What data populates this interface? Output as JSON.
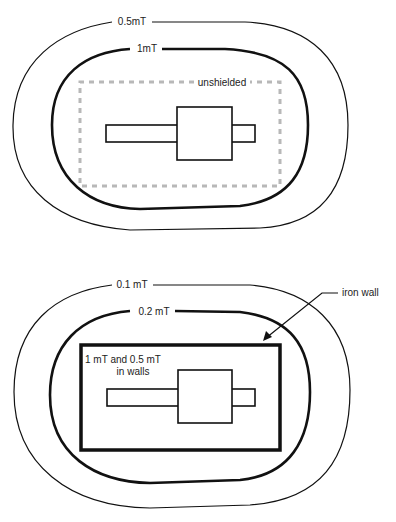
{
  "top_diagram": {
    "title": "unshielded",
    "outer_contour_label": "0.5mT",
    "inner_contour_label": "1mT",
    "enclosure_label": "unshielded",
    "enclosure_color": "#b8b8b8"
  },
  "bottom_diagram": {
    "outer_contour_label": "0.1 mT",
    "inner_contour_label": "0.2 mT",
    "wall_label": "iron wall",
    "wall_note_line1": "1 mT and 0.5 mT",
    "wall_note_line2": "in walls"
  },
  "colors": {
    "line": "#111111",
    "dashed": "#b8b8b8",
    "background": "#ffffff"
  }
}
